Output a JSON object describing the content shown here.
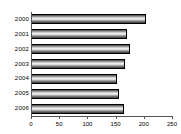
{
  "chart_data": {
    "type": "bar",
    "orientation": "horizontal",
    "title": "",
    "subtitle": "",
    "xlabel": "",
    "ylabel": "",
    "categories": [
      "2000",
      "2001",
      "2002",
      "2003",
      "2004",
      "2005",
      "2006"
    ],
    "values": [
      204,
      170,
      175,
      167,
      152,
      156,
      165
    ],
    "series": [
      {
        "name": "",
        "values": [
          204,
          170,
          175,
          167,
          152,
          156,
          165
        ]
      }
    ],
    "xlim": [
      0,
      250
    ],
    "xticks": [
      0,
      50,
      100,
      150,
      200,
      250
    ],
    "xtick_labels": [
      "0",
      "50",
      "100",
      "150",
      "200",
      "250"
    ],
    "grid": false,
    "legend": false,
    "legend_position": "none",
    "bar_color": "#b0b0b0",
    "bar_edge_color": "#000000",
    "background_color": "#ffffff",
    "axis_color": "#555555",
    "text_color": "#000000"
  }
}
